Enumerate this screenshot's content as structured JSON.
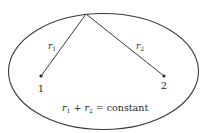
{
  "diagram": {
    "colors": {
      "stroke": "#3a3a3a",
      "text": "#2a2a2a",
      "background": "#ffffff"
    },
    "ellipse": {
      "cx": 103.5,
      "cy": 71.5,
      "rx": 95,
      "ry": 58
    },
    "point_on_ellipse": {
      "x": 86,
      "y": 14
    },
    "foci": [
      {
        "label": "1",
        "x": 41,
        "y": 76
      },
      {
        "label": "2",
        "x": 164,
        "y": 76
      }
    ],
    "segments": [
      {
        "name": "r1",
        "label_base": "r",
        "label_sub": "1"
      },
      {
        "name": "r2",
        "label_base": "r",
        "label_sub": "2"
      }
    ],
    "equation": {
      "r1_base": "r",
      "r1_sub": "1",
      "plus": " + ",
      "r2_base": "r",
      "r2_sub": "2",
      "equals": " = ",
      "rhs": "constant"
    }
  }
}
